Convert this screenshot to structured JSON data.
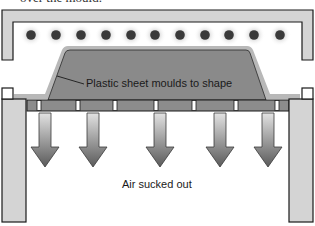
{
  "caption_top": "over the mould.",
  "labels": {
    "sheet": "Plastic sheet moulds to shape",
    "air": "Air sucked out"
  },
  "colors": {
    "frame_fill": "#d4d4d4",
    "frame_stroke": "#1a1a1a",
    "heater": "#3a3a3a",
    "heater_glow": "#9a9a9a",
    "mould_fill": "#8a8a8a",
    "sheet_outline": "#b8b8b8",
    "base_bar": "#8c8c8c",
    "arrow_light": "#d8d8d8",
    "arrow_dark": "#5a5a5a"
  },
  "heaters": [
    31,
    56,
    81,
    106,
    131,
    155,
    180,
    205,
    229,
    254,
    280
  ],
  "slots": [
    39,
    78,
    115,
    156,
    194,
    236,
    277
  ],
  "arrows": [
    45,
    93,
    160,
    220,
    268
  ]
}
